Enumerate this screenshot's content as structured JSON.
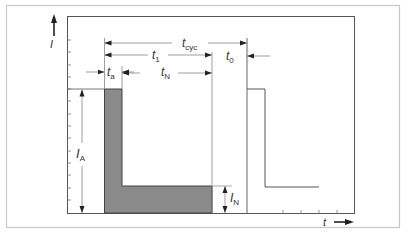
{
  "diagram": {
    "type": "current-time pulse diagram",
    "y_axis_label": "I",
    "x_axis_label": "t",
    "labels": {
      "t_cyc": {
        "base": "t",
        "sub": "cyc"
      },
      "t_1": {
        "base": "t",
        "sub": "1"
      },
      "t_0": {
        "base": "t",
        "sub": "0"
      },
      "t_N": {
        "base": "t",
        "sub": "N"
      },
      "t_a": {
        "base": "t",
        "sub": "a"
      },
      "I_A": {
        "base": "I",
        "sub": "A"
      },
      "I_N": {
        "base": "I",
        "sub": "N"
      }
    },
    "colors": {
      "frame": "#c8c8c8",
      "axes": "#444444",
      "fill": "#8a8a8a",
      "text": "#333333"
    }
  }
}
